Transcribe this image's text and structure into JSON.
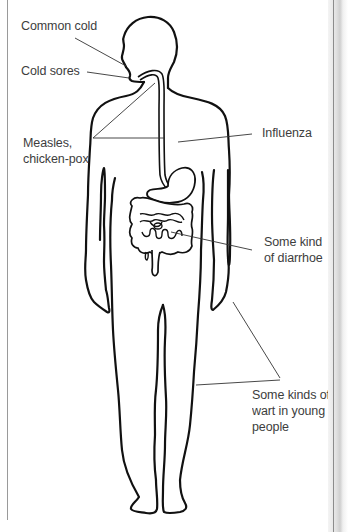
{
  "diagram": {
    "labels": [
      {
        "id": "common-cold",
        "lines": [
          "Common cold"
        ]
      },
      {
        "id": "cold-sores",
        "lines": [
          "Cold sores"
        ]
      },
      {
        "id": "measles",
        "lines": [
          "Measles,",
          "chicken-pox"
        ]
      },
      {
        "id": "influenza",
        "lines": [
          "Influenza"
        ]
      },
      {
        "id": "diarrhoea",
        "lines": [
          "Some kind",
          "of diarrhoe"
        ]
      },
      {
        "id": "warts",
        "lines": [
          "Some kinds of",
          "wart in young",
          "people"
        ]
      }
    ]
  },
  "colors": {
    "outline": "#111111",
    "leader_line": "#333333",
    "text": "#3d3d3d",
    "background": "#ffffff"
  }
}
